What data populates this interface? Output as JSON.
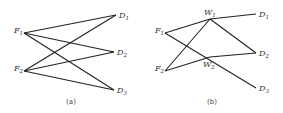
{
  "panels": [
    {
      "caption": "(a)",
      "nodes": [
        {
          "id": "F1",
          "letter": "F",
          "sub": "1",
          "x": 24,
          "y": 33
        },
        {
          "id": "F2",
          "letter": "F",
          "sub": "2",
          "x": 24,
          "y": 71
        },
        {
          "id": "D1",
          "letter": "D",
          "sub": "1",
          "x": 116,
          "y": 15
        },
        {
          "id": "D2",
          "letter": "D",
          "sub": "2",
          "x": 114,
          "y": 52
        },
        {
          "id": "D3",
          "letter": "D",
          "sub": "3",
          "x": 114,
          "y": 90
        }
      ],
      "edges": [
        [
          "F1",
          "D1"
        ],
        [
          "F1",
          "D2"
        ],
        [
          "F1",
          "D3"
        ],
        [
          "F2",
          "D1"
        ],
        [
          "F2",
          "D2"
        ],
        [
          "F2",
          "D3"
        ]
      ]
    },
    {
      "caption": "(b)",
      "nodes": [
        {
          "id": "F1",
          "letter": "F",
          "sub": "1",
          "x": 165,
          "y": 33
        },
        {
          "id": "F2",
          "letter": "F",
          "sub": "2",
          "x": 165,
          "y": 71
        },
        {
          "id": "W1",
          "letter": "W",
          "sub": "1",
          "x": 210,
          "y": 19
        },
        {
          "id": "W2",
          "letter": "W",
          "sub": "2",
          "x": 210,
          "y": 57
        },
        {
          "id": "D1",
          "letter": "D",
          "sub": "1",
          "x": 256,
          "y": 14
        },
        {
          "id": "D2",
          "letter": "D",
          "sub": "2",
          "x": 256,
          "y": 53
        },
        {
          "id": "D3",
          "letter": "D",
          "sub": "3",
          "x": 256,
          "y": 88
        }
      ],
      "edges": [
        [
          "F1",
          "W1"
        ],
        [
          "F2",
          "W1"
        ],
        [
          "F1",
          "D3"
        ],
        [
          "F2",
          "W2"
        ],
        [
          "W2",
          "D2"
        ],
        [
          "W1",
          "D1"
        ],
        [
          "W1",
          "D2"
        ]
      ]
    }
  ]
}
